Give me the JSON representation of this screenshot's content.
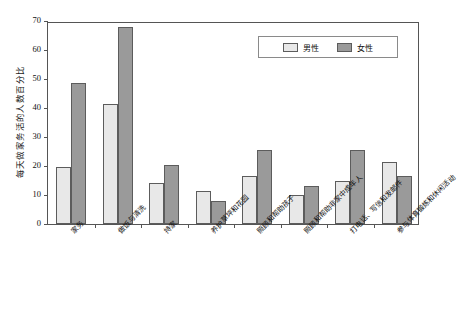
{
  "chart_data": {
    "type": "bar",
    "title": "",
    "subtitle": "",
    "xlabel": "",
    "ylabel": "每天做家务活的人数百分比",
    "ylim": [
      0,
      70
    ],
    "yticks": [
      0,
      10,
      20,
      30,
      40,
      50,
      60,
      70
    ],
    "grid": false,
    "legend_position": "top-right",
    "categories": [
      "家务",
      "做饭与清洗",
      "持家",
      "养护草坪和花园",
      "照顾和帮助孩子",
      "照顾和帮助非家中成年人",
      "打电话、写信和发邮件",
      "参与体育锻炼和休闲活动"
    ],
    "series": [
      {
        "name": "男性",
        "color": "#e8e8e8",
        "values": [
          19.5,
          41.5,
          14.0,
          11.5,
          16.5,
          10.0,
          15.0,
          21.5
        ]
      },
      {
        "name": "女性",
        "color": "#9a9a9a",
        "values": [
          48.5,
          68.0,
          20.5,
          8.0,
          25.5,
          13.0,
          25.5,
          16.5
        ]
      }
    ]
  },
  "legend": {
    "entries": [
      {
        "label": "男性",
        "swatch": "male"
      },
      {
        "label": "女性",
        "swatch": "female"
      }
    ]
  },
  "colors": {
    "male_bar": "#e8e8e8",
    "female_bar": "#9a9a9a",
    "bar_outline": "#5c5c5c",
    "axis": "#555555",
    "text": "#111111",
    "background": "#ffffff"
  }
}
